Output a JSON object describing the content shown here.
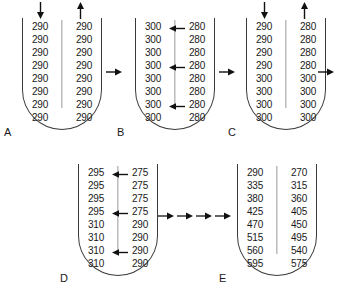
{
  "diagram": {
    "stage_count": 5,
    "rows_per_tube": 8,
    "colors": {
      "tube_outline": "#3a3a3a",
      "divider": "#9a9a9a",
      "text": "#1a1a1a",
      "arrow": "#111111",
      "background": "#ffffff"
    }
  },
  "panels": [
    {
      "label": "A",
      "has_top_arrows": true,
      "top_left_arrow": "arrow-down",
      "top_right_arrow": "arrow-up",
      "left_column": [
        "290",
        "290",
        "290",
        "290",
        "290",
        "290",
        "290",
        "290"
      ],
      "right_column": [
        "290",
        "290",
        "290",
        "290",
        "290",
        "290",
        "290",
        "290"
      ],
      "transfer_arrow_rows": []
    },
    {
      "label": "B",
      "has_top_arrows": false,
      "top_left_arrow": "",
      "top_right_arrow": "",
      "left_column": [
        "300",
        "300",
        "300",
        "300",
        "300",
        "300",
        "300",
        "300"
      ],
      "right_column": [
        "280",
        "280",
        "280",
        "280",
        "280",
        "280",
        "280",
        "280"
      ],
      "transfer_arrow_rows": [
        1,
        4,
        7
      ]
    },
    {
      "label": "C",
      "has_top_arrows": true,
      "top_left_arrow": "arrow-down",
      "top_right_arrow": "arrow-up",
      "left_column": [
        "290",
        "290",
        "290",
        "290",
        "300",
        "300",
        "300",
        "300"
      ],
      "right_column": [
        "280",
        "280",
        "280",
        "280",
        "300",
        "300",
        "300",
        "300"
      ],
      "transfer_arrow_rows": []
    },
    {
      "label": "D",
      "has_top_arrows": false,
      "top_left_arrow": "",
      "top_right_arrow": "",
      "left_column": [
        "295",
        "295",
        "295",
        "295",
        "310",
        "310",
        "310",
        "310"
      ],
      "right_column": [
        "275",
        "275",
        "275",
        "275",
        "290",
        "290",
        "290",
        "290"
      ],
      "transfer_arrow_rows": [
        1,
        4,
        7
      ]
    },
    {
      "label": "E",
      "has_top_arrows": false,
      "top_left_arrow": "",
      "top_right_arrow": "",
      "left_column": [
        "290",
        "335",
        "380",
        "425",
        "470",
        "515",
        "560",
        "595"
      ],
      "right_column": [
        "270",
        "315",
        "360",
        "405",
        "450",
        "495",
        "540",
        "575"
      ],
      "transfer_arrow_rows": []
    }
  ],
  "connectors": [
    {
      "name": "a-to-b",
      "icon": "arrow-right",
      "count": 1
    },
    {
      "name": "b-to-c",
      "icon": "arrow-right",
      "count": 1
    },
    {
      "name": "c-to-out",
      "icon": "arrow-right",
      "count": 1
    },
    {
      "name": "d-to-e",
      "icon": "arrow-right",
      "count": 4
    }
  ]
}
